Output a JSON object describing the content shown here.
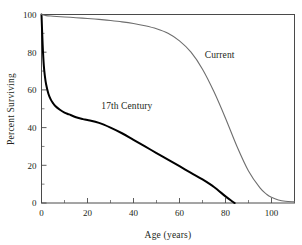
{
  "chart_data": {
    "type": "line",
    "title": "",
    "xlabel": "Age (years)",
    "ylabel": "Percent Surviving",
    "xlim": [
      0,
      110
    ],
    "ylim": [
      0,
      100
    ],
    "grid": false,
    "legend_position": "inline-annotation",
    "x_major_ticks": [
      0,
      20,
      40,
      60,
      80,
      100
    ],
    "x_major_tick_labels": [
      "0",
      "20",
      "40",
      "60",
      "80",
      "100"
    ],
    "x_minor_ticks": [
      10,
      30,
      50,
      70,
      90,
      110
    ],
    "y_major_ticks": [
      0,
      20,
      40,
      60,
      80,
      100
    ],
    "y_major_tick_labels": [
      "0",
      "20",
      "40",
      "60",
      "80",
      "100"
    ],
    "y_minor_ticks": [
      10,
      30,
      50,
      70,
      90
    ],
    "series": [
      {
        "name": "17th Century",
        "color": "#000000",
        "line_width": 2.0,
        "label_text": "17th Century",
        "label_x": 26,
        "label_y": 50,
        "x": [
          0,
          0.5,
          1,
          1.5,
          2,
          3,
          4,
          5,
          6,
          8,
          10,
          12,
          15,
          18,
          20,
          25,
          30,
          35,
          40,
          45,
          50,
          55,
          60,
          65,
          70,
          75,
          80,
          83,
          84
        ],
        "y": [
          100,
          84,
          73,
          67,
          63,
          58,
          55,
          53,
          51.5,
          49.5,
          48,
          47,
          45.5,
          44.5,
          44,
          42.5,
          40,
          37,
          33.5,
          30,
          26.5,
          23,
          19.5,
          16,
          12.5,
          8.5,
          3.5,
          0.8,
          0
        ]
      },
      {
        "name": "Current",
        "color": "#6e6e6e",
        "line_width": 1.1,
        "label_text": "Current",
        "label_x": 71,
        "label_y": 77,
        "x": [
          0,
          2,
          5,
          10,
          15,
          20,
          25,
          30,
          35,
          40,
          45,
          50,
          55,
          60,
          65,
          70,
          75,
          80,
          85,
          90,
          95,
          98,
          100,
          103,
          106,
          110
        ],
        "y": [
          100,
          99.4,
          99.1,
          98.7,
          98.3,
          97.9,
          97.4,
          96.8,
          96.1,
          95.2,
          94,
          92.4,
          90,
          86,
          80,
          71,
          59,
          45,
          30,
          17,
          8,
          4.5,
          3,
          1.6,
          0.9,
          0.6
        ]
      }
    ]
  },
  "figure": {
    "background_color": "#ffffff",
    "frame_color": "#4a4a4a"
  }
}
